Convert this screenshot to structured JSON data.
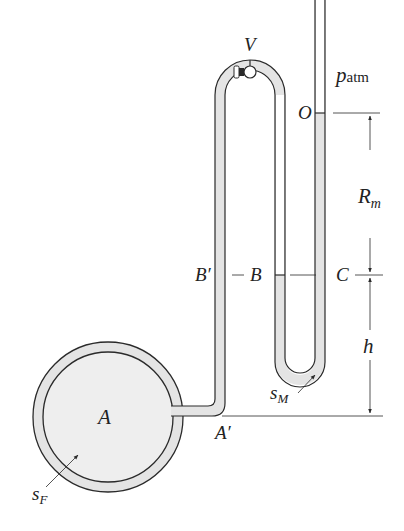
{
  "diagram": {
    "type": "manometer",
    "labels": {
      "valve": "V",
      "atm_p": "p",
      "atm_sub": "atm",
      "point_O": "O",
      "R": "R",
      "R_sub": "m",
      "point_B_prime": "B′",
      "point_B": "B",
      "point_C": "C",
      "h": "h",
      "sM": "s",
      "sM_sub": "M",
      "tank": "A",
      "point_A_prime": "A′",
      "sF": "s",
      "sF_sub": "F"
    },
    "colors": {
      "line": "#2a2a2a",
      "fluid": "#e4e4e4",
      "background": "#ffffff"
    }
  }
}
